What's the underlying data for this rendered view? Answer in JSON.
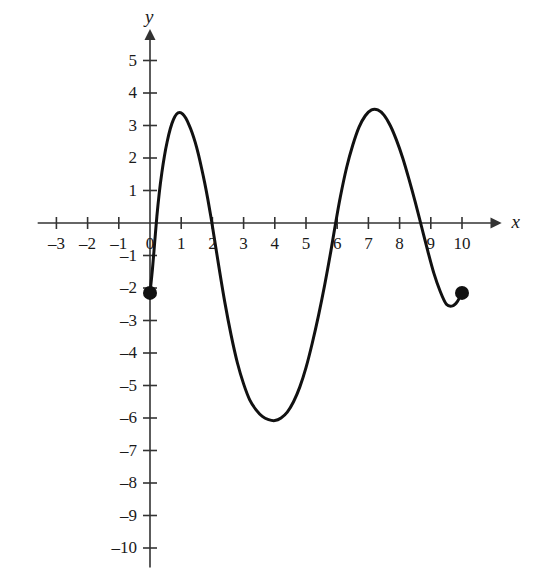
{
  "figure": {
    "background_color": "#ffffff",
    "ink_color": "#1a1a1a",
    "curve_color": "#111111",
    "axis_color": "#333333",
    "x_axis_name": "x",
    "y_axis_name": "y"
  },
  "chart_data": {
    "type": "line",
    "title": "",
    "subtitle": "",
    "xlabel": "x",
    "ylabel": "y",
    "xlim": [
      -3.6,
      11.2
    ],
    "ylim": [
      -10.6,
      5.9
    ],
    "grid": false,
    "legend": null,
    "x_ticks": [
      -3,
      -2,
      -1,
      0,
      1,
      2,
      3,
      4,
      5,
      6,
      7,
      8,
      9,
      10
    ],
    "x_tick_labels": [
      "–3",
      "–2",
      "–1",
      "0",
      "1",
      "2",
      "3",
      "4",
      "5",
      "6",
      "7",
      "8",
      "9",
      "10"
    ],
    "y_ticks": [
      5,
      4,
      3,
      2,
      1,
      -1,
      -2,
      -3,
      -4,
      -5,
      -6,
      -7,
      -8,
      -9,
      -10
    ],
    "y_tick_labels": [
      "5",
      "4",
      "3",
      "2",
      "1",
      "–1",
      "–2",
      "–3",
      "–4",
      "–5",
      "–6",
      "–7",
      "–8",
      "–9",
      "–10"
    ],
    "series": [
      {
        "name": "curve",
        "style": "solid",
        "width": 3,
        "domain": [
          0,
          10
        ],
        "points": [
          [
            0.0,
            -2.15
          ],
          [
            0.08,
            -1.4
          ],
          [
            0.15,
            -0.6
          ],
          [
            0.22,
            0.2
          ],
          [
            0.3,
            0.95
          ],
          [
            0.38,
            1.55
          ],
          [
            0.46,
            2.05
          ],
          [
            0.55,
            2.5
          ],
          [
            0.65,
            2.9
          ],
          [
            0.75,
            3.18
          ],
          [
            0.85,
            3.35
          ],
          [
            0.95,
            3.4
          ],
          [
            1.05,
            3.35
          ],
          [
            1.15,
            3.22
          ],
          [
            1.25,
            3.02
          ],
          [
            1.35,
            2.78
          ],
          [
            1.45,
            2.48
          ],
          [
            1.55,
            2.12
          ],
          [
            1.65,
            1.7
          ],
          [
            1.75,
            1.25
          ],
          [
            1.85,
            0.75
          ],
          [
            1.95,
            0.2
          ],
          [
            2.05,
            -0.4
          ],
          [
            2.2,
            -1.3
          ],
          [
            2.4,
            -2.45
          ],
          [
            2.6,
            -3.45
          ],
          [
            2.8,
            -4.3
          ],
          [
            3.0,
            -4.95
          ],
          [
            3.2,
            -5.45
          ],
          [
            3.4,
            -5.75
          ],
          [
            3.6,
            -5.95
          ],
          [
            3.8,
            -6.05
          ],
          [
            4.0,
            -6.08
          ],
          [
            4.2,
            -6.0
          ],
          [
            4.4,
            -5.82
          ],
          [
            4.6,
            -5.5
          ],
          [
            4.8,
            -5.05
          ],
          [
            5.0,
            -4.45
          ],
          [
            5.2,
            -3.7
          ],
          [
            5.4,
            -2.85
          ],
          [
            5.6,
            -1.9
          ],
          [
            5.8,
            -0.85
          ],
          [
            5.95,
            0.0
          ],
          [
            6.1,
            0.8
          ],
          [
            6.3,
            1.7
          ],
          [
            6.5,
            2.4
          ],
          [
            6.7,
            2.95
          ],
          [
            6.9,
            3.3
          ],
          [
            7.1,
            3.48
          ],
          [
            7.3,
            3.48
          ],
          [
            7.5,
            3.32
          ],
          [
            7.7,
            3.0
          ],
          [
            7.9,
            2.55
          ],
          [
            8.1,
            2.0
          ],
          [
            8.3,
            1.35
          ],
          [
            8.5,
            0.65
          ],
          [
            8.7,
            -0.1
          ],
          [
            8.9,
            -0.85
          ],
          [
            9.1,
            -1.55
          ],
          [
            9.3,
            -2.1
          ],
          [
            9.5,
            -2.5
          ],
          [
            9.7,
            -2.55
          ],
          [
            9.85,
            -2.42
          ],
          [
            10.0,
            -2.15
          ]
        ]
      }
    ],
    "markers": [
      {
        "name": "left-endpoint",
        "x": 0,
        "y": -2.15,
        "shape": "filled-circle",
        "radius": 7
      },
      {
        "name": "right-endpoint",
        "x": 10,
        "y": -2.15,
        "shape": "filled-circle",
        "radius": 7
      }
    ],
    "annotations": [],
    "features": {
      "local_maxima": [
        [
          0.95,
          3.4
        ],
        [
          7.2,
          3.5
        ]
      ],
      "local_minima": [
        [
          4.0,
          -6.1
        ]
      ],
      "x_intercepts": [
        0.25,
        2.0,
        5.95,
        8.68
      ],
      "endpoints": [
        [
          0,
          -2.15
        ],
        [
          10,
          -2.15
        ]
      ]
    }
  }
}
